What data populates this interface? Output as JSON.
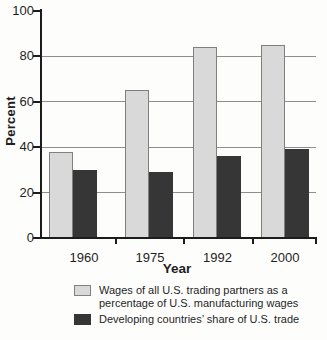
{
  "chart_data": {
    "type": "bar",
    "title": "",
    "xlabel": "Year",
    "ylabel": "Percent",
    "ylim": [
      0,
      100
    ],
    "yticks": [
      0,
      20,
      40,
      60,
      80,
      100
    ],
    "grid": "horizontal gridlines at 20, 40, 60, 80 drawn behind bars",
    "legend_position": "below chart",
    "categories": [
      "1960",
      "1975",
      "1992",
      "2000"
    ],
    "series": [
      {
        "name": "Wages of all U.S. trading partners as a percentage of U.S. manufacturing wages",
        "color": "#d9d9d9",
        "border": "#7f7f7f",
        "values": [
          38,
          65,
          84,
          85
        ]
      },
      {
        "name": "Developing countries’ share of U.S. trade",
        "color": "#363636",
        "border": "#363636",
        "values": [
          30,
          29,
          36,
          39
        ]
      }
    ]
  },
  "style": {
    "axis_color": "#1c1c1c",
    "grid_color": "#8e8e8e",
    "background": "#fdfdfc"
  }
}
